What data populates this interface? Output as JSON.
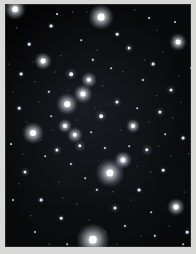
{
  "image": {
    "title": "Star field photograph",
    "subject": "open star cluster",
    "width": 196,
    "height": 254,
    "frame_color": "#d8d8d6",
    "sky_color": "#050506",
    "margin_px": 5,
    "sky": {
      "left": 5,
      "top": 4,
      "width": 186,
      "height": 243
    }
  },
  "stars": [
    {
      "x": 96,
      "y": 13,
      "r": 3.4,
      "color": "#ffffff",
      "glow": 13,
      "glow_color": "rgba(225,232,255,0.55)"
    },
    {
      "x": 88,
      "y": 236,
      "r": 4.2,
      "color": "#ffffff",
      "glow": 17,
      "glow_color": "rgba(230,235,255,0.60)"
    },
    {
      "x": 105,
      "y": 169,
      "r": 3.6,
      "color": "#fdfbff",
      "glow": 15,
      "glow_color": "rgba(220,228,255,0.52)"
    },
    {
      "x": 28,
      "y": 129,
      "r": 3.0,
      "color": "#ffffff",
      "glow": 11,
      "glow_color": "rgba(220,228,255,0.48)"
    },
    {
      "x": 118,
      "y": 156,
      "r": 2.5,
      "color": "#f4f6ff",
      "glow": 9,
      "glow_color": "rgba(210,220,255,0.42)"
    },
    {
      "x": 173,
      "y": 38,
      "r": 2.4,
      "color": "#ffffff",
      "glow": 9,
      "glow_color": "rgba(215,224,255,0.40)"
    },
    {
      "x": 171,
      "y": 203,
      "r": 2.5,
      "color": "#fdfdff",
      "glow": 9,
      "glow_color": "rgba(215,224,255,0.40)"
    },
    {
      "x": 10,
      "y": 5,
      "r": 2.8,
      "color": "#ffffff",
      "glow": 11,
      "glow_color": "rgba(220,228,255,0.45)"
    },
    {
      "x": 62,
      "y": 100,
      "r": 2.8,
      "color": "#fffefc",
      "glow": 11,
      "glow_color": "rgba(225,225,245,0.46)"
    },
    {
      "x": 78,
      "y": 90,
      "r": 2.6,
      "color": "#ffffff",
      "glow": 10,
      "glow_color": "rgba(220,226,252,0.44)"
    },
    {
      "x": 84,
      "y": 76,
      "r": 2.2,
      "color": "#f6f8ff",
      "glow": 8,
      "glow_color": "rgba(205,215,250,0.38)"
    },
    {
      "x": 66,
      "y": 70,
      "r": 1.8,
      "color": "#eef2ff",
      "glow": 6,
      "glow_color": "rgba(200,212,250,0.32)"
    },
    {
      "x": 38,
      "y": 57,
      "r": 2.4,
      "color": "#ffffff",
      "glow": 9,
      "glow_color": "rgba(218,224,252,0.40)"
    },
    {
      "x": 60,
      "y": 122,
      "r": 2.0,
      "color": "#fafbff",
      "glow": 7,
      "glow_color": "rgba(208,216,250,0.34)"
    },
    {
      "x": 70,
      "y": 131,
      "r": 2.2,
      "color": "#ffffff",
      "glow": 8,
      "glow_color": "rgba(212,220,250,0.36)"
    },
    {
      "x": 75,
      "y": 142,
      "r": 1.7,
      "color": "#eef1fb",
      "glow": 6,
      "glow_color": "rgba(200,210,245,0.30)"
    },
    {
      "x": 52,
      "y": 146,
      "r": 1.6,
      "color": "#e8edfa",
      "glow": 5,
      "glow_color": "rgba(195,206,244,0.28)"
    },
    {
      "x": 96,
      "y": 112,
      "r": 1.8,
      "color": "#f2f5ff",
      "glow": 6,
      "glow_color": "rgba(200,212,248,0.30)"
    },
    {
      "x": 112,
      "y": 98,
      "r": 1.5,
      "color": "#e6ebf8",
      "glow": 5,
      "glow_color": "rgba(195,206,244,0.26)"
    },
    {
      "x": 128,
      "y": 122,
      "r": 2.0,
      "color": "#fbfcff",
      "glow": 7,
      "glow_color": "rgba(205,215,248,0.32)"
    },
    {
      "x": 142,
      "y": 146,
      "r": 1.7,
      "color": "#eff2fd",
      "glow": 6,
      "glow_color": "rgba(200,210,246,0.28)"
    },
    {
      "x": 155,
      "y": 108,
      "r": 1.6,
      "color": "#e9eefb",
      "glow": 5,
      "glow_color": "rgba(196,207,245,0.26)"
    },
    {
      "x": 166,
      "y": 86,
      "r": 1.5,
      "color": "#e4eaf8",
      "glow": 5,
      "glow_color": "rgba(194,206,244,0.24)"
    },
    {
      "x": 148,
      "y": 60,
      "r": 1.4,
      "color": "#dfe6f6",
      "glow": 4,
      "glow_color": "rgba(190,202,242,0.22)"
    },
    {
      "x": 124,
      "y": 44,
      "r": 1.5,
      "color": "#e6ecfa",
      "glow": 5,
      "glow_color": "rgba(194,206,244,0.24)"
    },
    {
      "x": 112,
      "y": 30,
      "r": 1.3,
      "color": "#dde4f5",
      "glow": 4,
      "glow_color": "rgba(188,200,240,0.20)"
    },
    {
      "x": 46,
      "y": 22,
      "r": 1.4,
      "color": "#e2e8f7",
      "glow": 4,
      "glow_color": "rgba(190,202,242,0.22)"
    },
    {
      "x": 24,
      "y": 40,
      "r": 1.3,
      "color": "#dce3f4",
      "glow": 4,
      "glow_color": "rgba(186,199,240,0.20)"
    },
    {
      "x": 16,
      "y": 70,
      "r": 1.4,
      "color": "#e0e7f6",
      "glow": 4,
      "glow_color": "rgba(189,201,241,0.21)"
    },
    {
      "x": 14,
      "y": 104,
      "r": 1.3,
      "color": "#dbe2f4",
      "glow": 4,
      "glow_color": "rgba(186,199,239,0.20)"
    },
    {
      "x": 20,
      "y": 168,
      "r": 1.5,
      "color": "#e6ecfa",
      "glow": 5,
      "glow_color": "rgba(194,206,243,0.24)"
    },
    {
      "x": 36,
      "y": 196,
      "r": 1.4,
      "color": "#e1e8f7",
      "glow": 4,
      "glow_color": "rgba(190,202,241,0.22)"
    },
    {
      "x": 56,
      "y": 214,
      "r": 1.3,
      "color": "#dbe3f4",
      "glow": 4,
      "glow_color": "rgba(186,199,239,0.20)"
    },
    {
      "x": 110,
      "y": 204,
      "r": 1.6,
      "color": "#ebf0fc",
      "glow": 5,
      "glow_color": "rgba(197,208,245,0.26)"
    },
    {
      "x": 134,
      "y": 186,
      "r": 1.4,
      "color": "#e1e7f7",
      "glow": 4,
      "glow_color": "rgba(190,202,241,0.22)"
    },
    {
      "x": 158,
      "y": 166,
      "r": 1.3,
      "color": "#dce3f5",
      "glow": 4,
      "glow_color": "rgba(186,199,239,0.20)"
    },
    {
      "x": 178,
      "y": 134,
      "r": 1.4,
      "color": "#e0e6f6",
      "glow": 4,
      "glow_color": "rgba(189,201,241,0.21)"
    },
    {
      "x": 182,
      "y": 228,
      "r": 1.3,
      "color": "#dbe2f4",
      "glow": 4,
      "glow_color": "rgba(186,198,239,0.20)"
    },
    {
      "x": 150,
      "y": 232,
      "r": 1.2,
      "color": "#d6def1",
      "glow": 3,
      "glow_color": "rgba(182,195,236,0.18)"
    },
    {
      "x": 92,
      "y": 186,
      "r": 1.2,
      "color": "#d8e0f2",
      "glow": 3,
      "glow_color": "rgba(183,196,237,0.18)"
    },
    {
      "x": 44,
      "y": 88,
      "r": 1.2,
      "color": "#d6def1",
      "glow": 3,
      "glow_color": "rgba(182,195,236,0.18)"
    },
    {
      "x": 88,
      "y": 56,
      "r": 1.2,
      "color": "#d9e1f3",
      "glow": 3,
      "glow_color": "rgba(184,196,237,0.18)"
    },
    {
      "x": 138,
      "y": 76,
      "r": 1.1,
      "color": "#d2daee",
      "glow": 3,
      "glow_color": "rgba(179,192,233,0.16)"
    },
    {
      "x": 100,
      "y": 144,
      "r": 1.1,
      "color": "#d4dcf0",
      "glow": 3,
      "glow_color": "rgba(180,193,234,0.16)"
    },
    {
      "x": 66,
      "y": 160,
      "r": 1.1,
      "color": "#d2daee",
      "glow": 3,
      "glow_color": "rgba(179,192,233,0.16)"
    },
    {
      "x": 120,
      "y": 222,
      "r": 1.1,
      "color": "#d0d9ed",
      "glow": 3,
      "glow_color": "rgba(178,191,232,0.16)"
    },
    {
      "x": 30,
      "y": 228,
      "r": 1.0,
      "color": "#ccd5eb",
      "glow": 0,
      "glow_color": "rgba(0,0,0,0)"
    },
    {
      "x": 170,
      "y": 18,
      "r": 1.0,
      "color": "#ccd5eb",
      "glow": 0,
      "glow_color": "rgba(0,0,0,0)"
    },
    {
      "x": 8,
      "y": 196,
      "r": 1.0,
      "color": "#c9d3ea",
      "glow": 0,
      "glow_color": "rgba(0,0,0,0)"
    },
    {
      "x": 186,
      "y": 64,
      "r": 1.0,
      "color": "#c9d3ea",
      "glow": 0,
      "glow_color": "rgba(0,0,0,0)"
    },
    {
      "x": 52,
      "y": 10,
      "r": 0.9,
      "color": "#c2cde5",
      "glow": 0,
      "glow_color": "rgba(0,0,0,0)"
    },
    {
      "x": 144,
      "y": 14,
      "r": 0.9,
      "color": "#c2cde5",
      "glow": 0,
      "glow_color": "rgba(0,0,0,0)"
    },
    {
      "x": 6,
      "y": 140,
      "r": 0.9,
      "color": "#c0cbe3",
      "glow": 0,
      "glow_color": "rgba(0,0,0,0)"
    },
    {
      "x": 190,
      "y": 176,
      "r": 0.9,
      "color": "#c0cbe3",
      "glow": 0,
      "glow_color": "rgba(0,0,0,0)"
    },
    {
      "x": 76,
      "y": 36,
      "r": 0.8,
      "color": "#b8c4de",
      "glow": 0,
      "glow_color": "rgba(0,0,0,0)"
    },
    {
      "x": 106,
      "y": 64,
      "r": 0.8,
      "color": "#b8c4de",
      "glow": 0,
      "glow_color": "rgba(0,0,0,0)"
    },
    {
      "x": 132,
      "y": 104,
      "r": 0.8,
      "color": "#b6c2dc",
      "glow": 0,
      "glow_color": "rgba(0,0,0,0)"
    },
    {
      "x": 86,
      "y": 128,
      "r": 0.8,
      "color": "#b6c2dc",
      "glow": 0,
      "glow_color": "rgba(0,0,0,0)"
    },
    {
      "x": 46,
      "y": 112,
      "r": 0.8,
      "color": "#b4c0da",
      "glow": 0,
      "glow_color": "rgba(0,0,0,0)"
    },
    {
      "x": 160,
      "y": 130,
      "r": 0.8,
      "color": "#b4c0da",
      "glow": 0,
      "glow_color": "rgba(0,0,0,0)"
    },
    {
      "x": 124,
      "y": 142,
      "r": 0.8,
      "color": "#b2bed8",
      "glow": 0,
      "glow_color": "rgba(0,0,0,0)"
    },
    {
      "x": 80,
      "y": 174,
      "r": 0.8,
      "color": "#b2bed8",
      "glow": 0,
      "glow_color": "rgba(0,0,0,0)"
    },
    {
      "x": 40,
      "y": 152,
      "r": 0.8,
      "color": "#b0bcd6",
      "glow": 0,
      "glow_color": "rgba(0,0,0,0)"
    },
    {
      "x": 146,
      "y": 208,
      "r": 0.8,
      "color": "#b0bcd6",
      "glow": 0,
      "glow_color": "rgba(0,0,0,0)"
    },
    {
      "x": 62,
      "y": 240,
      "r": 0.8,
      "color": "#aeb9d4",
      "glow": 0,
      "glow_color": "rgba(0,0,0,0)"
    },
    {
      "x": 178,
      "y": 240,
      "r": 0.8,
      "color": "#aeb9d4",
      "glow": 0,
      "glow_color": "rgba(0,0,0,0)"
    },
    {
      "x": 12,
      "y": 24,
      "r": 0.7,
      "color": "#a6b2cd",
      "glow": 0,
      "glow_color": "rgba(0,0,0,0)"
    },
    {
      "x": 30,
      "y": 78,
      "r": 0.7,
      "color": "#a6b2cd",
      "glow": 0,
      "glow_color": "rgba(0,0,0,0)"
    },
    {
      "x": 56,
      "y": 52,
      "r": 0.7,
      "color": "#a4b0cb",
      "glow": 0,
      "glow_color": "rgba(0,0,0,0)"
    },
    {
      "x": 98,
      "y": 82,
      "r": 0.7,
      "color": "#a4b0cb",
      "glow": 0,
      "glow_color": "rgba(0,0,0,0)"
    },
    {
      "x": 118,
      "y": 68,
      "r": 0.7,
      "color": "#a2aec9",
      "glow": 0,
      "glow_color": "rgba(0,0,0,0)"
    },
    {
      "x": 152,
      "y": 92,
      "r": 0.7,
      "color": "#a2aec9",
      "glow": 0,
      "glow_color": "rgba(0,0,0,0)"
    },
    {
      "x": 168,
      "y": 114,
      "r": 0.7,
      "color": "#a0acc7",
      "glow": 0,
      "glow_color": "rgba(0,0,0,0)"
    },
    {
      "x": 184,
      "y": 150,
      "r": 0.7,
      "color": "#a0acc7",
      "glow": 0,
      "glow_color": "rgba(0,0,0,0)"
    },
    {
      "x": 146,
      "y": 168,
      "r": 0.7,
      "color": "#9eaac5",
      "glow": 0,
      "glow_color": "rgba(0,0,0,0)"
    },
    {
      "x": 108,
      "y": 188,
      "r": 0.7,
      "color": "#9eaac5",
      "glow": 0,
      "glow_color": "rgba(0,0,0,0)"
    },
    {
      "x": 72,
      "y": 200,
      "r": 0.7,
      "color": "#9ca8c3",
      "glow": 0,
      "glow_color": "rgba(0,0,0,0)"
    },
    {
      "x": 26,
      "y": 212,
      "r": 0.7,
      "color": "#9ca8c3",
      "glow": 0,
      "glow_color": "rgba(0,0,0,0)"
    },
    {
      "x": 14,
      "y": 180,
      "r": 0.7,
      "color": "#9aa6c1",
      "glow": 0,
      "glow_color": "rgba(0,0,0,0)"
    },
    {
      "x": 190,
      "y": 100,
      "r": 0.7,
      "color": "#9aa6c1",
      "glow": 0,
      "glow_color": "rgba(0,0,0,0)"
    },
    {
      "x": 68,
      "y": 8,
      "r": 0.7,
      "color": "#98a4bf",
      "glow": 0,
      "glow_color": "rgba(0,0,0,0)"
    },
    {
      "x": 130,
      "y": 6,
      "r": 0.7,
      "color": "#98a4bf",
      "glow": 0,
      "glow_color": "rgba(0,0,0,0)"
    },
    {
      "x": 158,
      "y": 48,
      "r": 0.6,
      "color": "#909cb6",
      "glow": 0,
      "glow_color": "rgba(0,0,0,0)"
    },
    {
      "x": 92,
      "y": 46,
      "r": 0.6,
      "color": "#909cb6",
      "glow": 0,
      "glow_color": "rgba(0,0,0,0)"
    },
    {
      "x": 34,
      "y": 98,
      "r": 0.6,
      "color": "#8e9ab4",
      "glow": 0,
      "glow_color": "rgba(0,0,0,0)"
    },
    {
      "x": 54,
      "y": 178,
      "r": 0.6,
      "color": "#8e9ab4",
      "glow": 0,
      "glow_color": "rgba(0,0,0,0)"
    },
    {
      "x": 136,
      "y": 232,
      "r": 0.6,
      "color": "#8c98b2",
      "glow": 0,
      "glow_color": "rgba(0,0,0,0)"
    },
    {
      "x": 100,
      "y": 228,
      "r": 0.6,
      "color": "#8c98b2",
      "glow": 0,
      "glow_color": "rgba(0,0,0,0)"
    },
    {
      "x": 164,
      "y": 222,
      "r": 0.6,
      "color": "#8a96b0",
      "glow": 0,
      "glow_color": "rgba(0,0,0,0)"
    },
    {
      "x": 44,
      "y": 240,
      "r": 0.6,
      "color": "#8a96b0",
      "glow": 0,
      "glow_color": "rgba(0,0,0,0)"
    },
    {
      "x": 4,
      "y": 60,
      "r": 0.6,
      "color": "#8894ae",
      "glow": 0,
      "glow_color": "rgba(0,0,0,0)"
    },
    {
      "x": 186,
      "y": 12,
      "r": 0.6,
      "color": "#8894ae",
      "glow": 0,
      "glow_color": "rgba(0,0,0,0)"
    },
    {
      "x": 116,
      "y": 126,
      "r": 0.6,
      "color": "#8692ac",
      "glow": 0,
      "glow_color": "rgba(0,0,0,0)"
    },
    {
      "x": 72,
      "y": 116,
      "r": 0.6,
      "color": "#8692ac",
      "glow": 0,
      "glow_color": "rgba(0,0,0,0)"
    },
    {
      "x": 50,
      "y": 68,
      "r": 0.6,
      "color": "#8490aa",
      "glow": 0,
      "glow_color": "rgba(0,0,0,0)"
    },
    {
      "x": 140,
      "y": 56,
      "r": 0.6,
      "color": "#8490aa",
      "glow": 0,
      "glow_color": "rgba(0,0,0,0)"
    },
    {
      "x": 174,
      "y": 72,
      "r": 0.6,
      "color": "#828ea8",
      "glow": 0,
      "glow_color": "rgba(0,0,0,0)"
    },
    {
      "x": 22,
      "y": 118,
      "r": 0.6,
      "color": "#828ea8",
      "glow": 0,
      "glow_color": "rgba(0,0,0,0)"
    },
    {
      "x": 94,
      "y": 156,
      "r": 0.6,
      "color": "#808ca6",
      "glow": 0,
      "glow_color": "rgba(0,0,0,0)"
    },
    {
      "x": 154,
      "y": 142,
      "r": 0.6,
      "color": "#808ca6",
      "glow": 0,
      "glow_color": "rgba(0,0,0,0)"
    },
    {
      "x": 18,
      "y": 150,
      "r": 0.6,
      "color": "#7e8aa4",
      "glow": 0,
      "glow_color": "rgba(0,0,0,0)"
    },
    {
      "x": 126,
      "y": 196,
      "r": 0.6,
      "color": "#7e8aa4",
      "glow": 0,
      "glow_color": "rgba(0,0,0,0)"
    },
    {
      "x": 84,
      "y": 216,
      "r": 0.6,
      "color": "#7c88a2",
      "glow": 0,
      "glow_color": "rgba(0,0,0,0)"
    },
    {
      "x": 180,
      "y": 188,
      "r": 0.6,
      "color": "#7c88a2",
      "glow": 0,
      "glow_color": "rgba(0,0,0,0)"
    },
    {
      "x": 64,
      "y": 86,
      "r": 0.5,
      "color": "#74809a",
      "glow": 0,
      "glow_color": "rgba(0,0,0,0)"
    },
    {
      "x": 104,
      "y": 100,
      "r": 0.5,
      "color": "#74809a",
      "glow": 0,
      "glow_color": "rgba(0,0,0,0)"
    },
    {
      "x": 36,
      "y": 136,
      "r": 0.5,
      "color": "#727e98",
      "glow": 0,
      "glow_color": "rgba(0,0,0,0)"
    },
    {
      "x": 144,
      "y": 118,
      "r": 0.5,
      "color": "#727e98",
      "glow": 0,
      "glow_color": "rgba(0,0,0,0)"
    },
    {
      "x": 8,
      "y": 88,
      "r": 0.5,
      "color": "#707c96",
      "glow": 0,
      "glow_color": "rgba(0,0,0,0)"
    },
    {
      "x": 192,
      "y": 210,
      "r": 0.5,
      "color": "#707c96",
      "glow": 0,
      "glow_color": "rgba(0,0,0,0)"
    },
    {
      "x": 58,
      "y": 194,
      "r": 0.5,
      "color": "#6e7a94",
      "glow": 0,
      "glow_color": "rgba(0,0,0,0)"
    },
    {
      "x": 112,
      "y": 240,
      "r": 0.5,
      "color": "#6e7a94",
      "glow": 0,
      "glow_color": "rgba(0,0,0,0)"
    },
    {
      "x": 166,
      "y": 152,
      "r": 0.5,
      "color": "#6c7892",
      "glow": 0,
      "glow_color": "rgba(0,0,0,0)"
    },
    {
      "x": 28,
      "y": 58,
      "r": 0.5,
      "color": "#6c7892",
      "glow": 0,
      "glow_color": "rgba(0,0,0,0)"
    },
    {
      "x": 82,
      "y": 8,
      "r": 0.5,
      "color": "#6a7690",
      "glow": 0,
      "glow_color": "rgba(0,0,0,0)"
    },
    {
      "x": 152,
      "y": 26,
      "r": 0.5,
      "color": "#6a7690",
      "glow": 0,
      "glow_color": "rgba(0,0,0,0)"
    },
    {
      "x": 48,
      "y": 126,
      "r": 0.5,
      "color": "#68748e",
      "glow": 0,
      "glow_color": "rgba(0,0,0,0)"
    },
    {
      "x": 132,
      "y": 162,
      "r": 0.5,
      "color": "#68748e",
      "glow": 0,
      "glow_color": "rgba(0,0,0,0)"
    },
    {
      "x": 90,
      "y": 104,
      "r": 0.5,
      "color": "#66728c",
      "glow": 0,
      "glow_color": "rgba(0,0,0,0)"
    },
    {
      "x": 176,
      "y": 98,
      "r": 0.5,
      "color": "#66728c",
      "glow": 0,
      "glow_color": "rgba(0,0,0,0)"
    }
  ]
}
